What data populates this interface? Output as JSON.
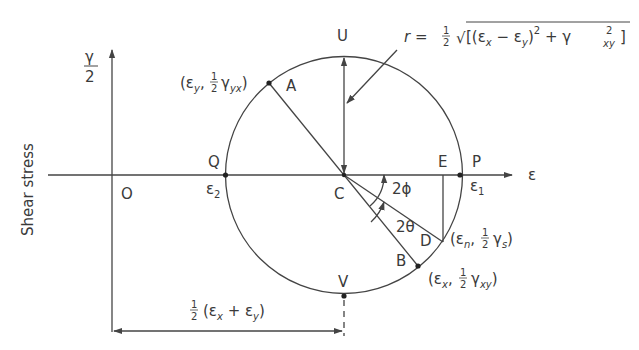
{
  "diagram": {
    "axis": {
      "y_label_top": "γ",
      "y_label_bottom": "2",
      "y_side_label": "Shear stress",
      "x_label": "ε",
      "origin_label": "O"
    },
    "points": {
      "Q": "Q",
      "P": "P",
      "C": "C",
      "U": "U",
      "V": "V",
      "A": "A",
      "B": "B",
      "D": "D",
      "E": "E"
    },
    "principal": {
      "eps2": "ε",
      "eps2_sub": "2",
      "eps1": "ε",
      "eps1_sub": "1"
    },
    "angles": {
      "phi": "2ϕ",
      "theta": "2θ"
    },
    "coords": {
      "A": {
        "open": "(ε",
        "sub1": "y",
        "comma": ",",
        "half_num": "1",
        "half_den": "2",
        "gamma": "γ",
        "sub2": "yx",
        "close": ")"
      },
      "D": {
        "open": "(ε",
        "sub1": "n",
        "comma": ",",
        "half_num": "1",
        "half_den": "2",
        "gamma": "γ",
        "sub2": "s",
        "close": ")"
      },
      "B": {
        "open": "(ε",
        "sub1": "x",
        "comma": ",",
        "half_num": "1",
        "half_den": "2",
        "gamma": "γ",
        "sub2": "xy",
        "close": ")"
      }
    },
    "radius_formula": {
      "r": "r =",
      "half_num": "1",
      "half_den": "2",
      "root": "√",
      "body1": "[(ε",
      "sub_x": "x",
      "minus": " − ε",
      "sub_y": "y",
      "close_sq": ")",
      "sq": "2",
      "plus": "  +  γ",
      "gamma_sq": "2",
      "gamma_sub": "xy",
      "end": "]"
    },
    "center_dim": {
      "half_num": "1",
      "half_den": "2",
      "body": "(ε",
      "sub_x": "x",
      "plus": " + ε",
      "sub_y": "y",
      "close": ")"
    },
    "colors": {
      "line": "#444444",
      "text": "#3a3a3a",
      "background": "#ffffff"
    }
  }
}
